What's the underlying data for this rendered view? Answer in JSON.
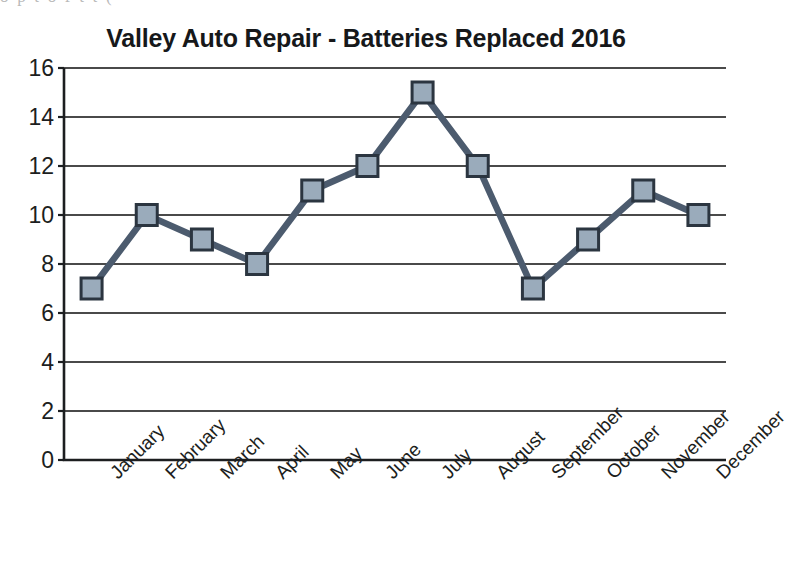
{
  "page": {
    "scan_artifact_text": "o   p   t   o f   t   t   ("
  },
  "chart_data": {
    "type": "line",
    "title": "Valley Auto Repair - Batteries Replaced 2016",
    "xlabel": "",
    "ylabel": "",
    "categories": [
      "January",
      "February",
      "March",
      "April",
      "May",
      "June",
      "July",
      "August",
      "September",
      "October",
      "November",
      "December"
    ],
    "values": [
      7,
      10,
      9,
      8,
      11,
      12,
      15,
      12,
      7,
      9,
      11,
      10
    ],
    "ylim": [
      0,
      16
    ],
    "ytick_step": 2,
    "ytick_labels": [
      "0",
      "2",
      "4",
      "6",
      "8",
      "10",
      "12",
      "14",
      "16"
    ],
    "grid": true,
    "grid_axis": "y",
    "legend": false,
    "series": [
      {
        "name": "Batteries Replaced",
        "values": [
          7,
          10,
          9,
          8,
          11,
          12,
          15,
          12,
          7,
          9,
          11,
          10
        ]
      }
    ],
    "colors": {
      "line": "#4c5b6e",
      "marker_fill": "#9aabbb",
      "marker_edge": "#2b3540",
      "grid": "#4a4a4a",
      "axis": "#1c1e20",
      "text": "#1c1e20",
      "background": "#ffffff"
    }
  }
}
